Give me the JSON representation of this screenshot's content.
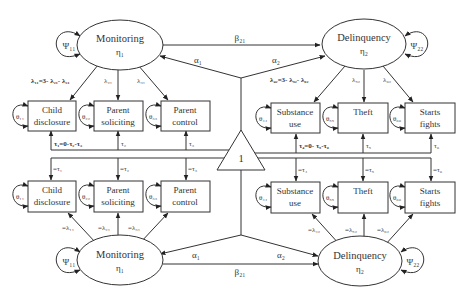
{
  "latent": {
    "top_monitoring": {
      "name": "Monitoring",
      "sym": "η₁"
    },
    "top_delinquency": {
      "name": "Delinquency",
      "sym": "η₂"
    },
    "bottom_monitoring": {
      "name": "Monitoring",
      "sym": "η₁"
    },
    "bottom_delinquency": {
      "name": "Delinquency",
      "sym": "η₂"
    }
  },
  "constant": {
    "label": "1"
  },
  "indicators_top": [
    {
      "line1": "Child",
      "line2": "disclosure",
      "theta": "θ₁₁"
    },
    {
      "line1": "Parent",
      "line2": "soliciting",
      "theta": "θ₂₂"
    },
    {
      "line1": "Parent",
      "line2": "control",
      "theta": "θ₃₃"
    },
    {
      "line1": "Substance",
      "line2": "use",
      "theta": "θ₄₄"
    },
    {
      "line1": "Theft",
      "line2": "",
      "theta": "θ₅₅"
    },
    {
      "line1": "Starts",
      "line2": "fights",
      "theta": "θ₆₆"
    }
  ],
  "indicators_bottom": [
    {
      "line1": "Child",
      "line2": "disclosure",
      "theta": "θ₁₁"
    },
    {
      "line1": "Parent",
      "line2": "soliciting",
      "theta": "θ₂₂"
    },
    {
      "line1": "Parent",
      "line2": "control",
      "theta": "θ₃₃"
    },
    {
      "line1": "Substance",
      "line2": "use",
      "theta": "θ₄₄"
    },
    {
      "line1": "Theft",
      "line2": "",
      "theta": "θ₅₅"
    },
    {
      "line1": "Starts",
      "line2": "fights",
      "theta": "θ₆₆"
    }
  ],
  "variances": {
    "psi11_top": "Ψ₁₁",
    "psi22_top": "Ψ₂₂",
    "psi11_bottom": "Ψ₁₁",
    "psi22_bottom": "Ψ₂₂"
  },
  "paths": {
    "beta21_top": "β₂₁",
    "beta21_bottom": "β₂₁",
    "alpha1_top": "α₁",
    "alpha2_top": "α₂",
    "alpha1_bottom": "α₁",
    "alpha2_bottom": "α₂"
  },
  "loadings_top": {
    "l11": "λ₁₁=3- λ₂₁- λ₃₁",
    "l21": "λ₂₁",
    "l31": "λ₃₁",
    "l42": "λ₄₂=3- λ₅₂- λ₆₂",
    "l52": "λ₅₂",
    "l62": "λ₆₂"
  },
  "loadings_bottom": {
    "l11": "=λ₁₁",
    "l21": "=λ₂₁",
    "l31": "=λ₃₁",
    "l42": "=λ₄₂",
    "l52": "=λ₅₂",
    "l62": "=λ₆₂"
  },
  "intercepts_top": {
    "t1": "τ₁=0-τ₂-τ₃",
    "t2": "τ₂",
    "t3": "τ₃",
    "t4": "τ₄=0- τ₅-τ₆",
    "t5": "τ₅",
    "t6": "τ₆"
  },
  "intercepts_bottom": {
    "t1": "=τ₁",
    "t2": "=τ₂",
    "t3": "=τ₃",
    "t4": "=τ₄",
    "t5": "=τ₅",
    "t6": "=τ₆"
  }
}
